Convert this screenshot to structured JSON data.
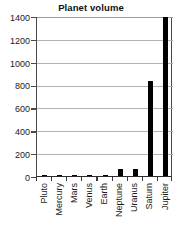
{
  "chart_data": {
    "type": "bar",
    "title": "Planet volume",
    "xlabel": "",
    "ylabel": "",
    "categories": [
      "Pluto",
      "Mercury",
      "Mars",
      "Venus",
      "Earth",
      "Neptune",
      "Uranus",
      "Saturn",
      "Jupiter"
    ],
    "values": [
      0,
      0,
      0,
      0,
      1,
      58,
      63,
      840,
      1400
    ],
    "ylim": [
      0,
      1400
    ],
    "yticks": [
      0,
      200,
      400,
      600,
      800,
      1000,
      1200,
      1400
    ],
    "ytick_labels": [
      "0",
      "200",
      "400",
      "600",
      "800",
      "1000",
      "1200",
      "1400"
    ],
    "grid": true,
    "legend": false,
    "bar_color": "#000000",
    "gridline_color": "#b3b3b3",
    "axis_color": "#3a3a3a",
    "background": "#ffffff"
  }
}
